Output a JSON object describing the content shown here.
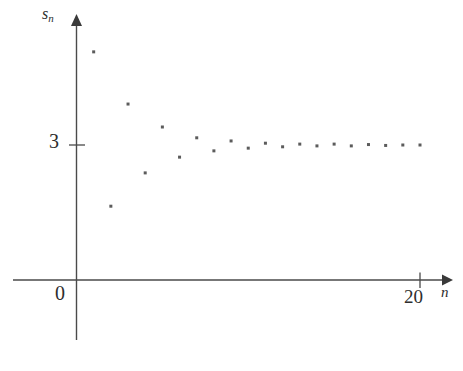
{
  "figure": {
    "background_color": "#ffffff",
    "axis_color": "#4a4a4a",
    "point_color": "#5c5c5c",
    "label_color": "#2e2e2e"
  },
  "labels": {
    "y_axis_name_base": "s",
    "y_axis_name_subscript": "n",
    "y_tick_3": "3",
    "origin_zero": "0",
    "x_tick_20": "20",
    "x_axis_name": "n"
  },
  "chart_data": {
    "type": "scatter",
    "title": "",
    "xlabel": "n",
    "ylabel": "s_n",
    "grid": false,
    "legend": "none",
    "xlim": [
      0,
      21.5
    ],
    "ylim": [
      0,
      6.2
    ],
    "x_ticks": [
      0,
      20
    ],
    "x_tick_labels": [
      "0",
      "20"
    ],
    "y_ticks": [
      0,
      3
    ],
    "y_tick_labels": [
      "0",
      "3"
    ],
    "marker": "square",
    "marker_size_px": 3,
    "x": [
      1,
      2,
      3,
      4,
      5,
      6,
      7,
      8,
      9,
      10,
      11,
      12,
      13,
      14,
      15,
      16,
      17,
      18,
      19,
      20
    ],
    "values": [
      5.07,
      1.64,
      3.91,
      2.38,
      3.4,
      2.73,
      3.16,
      2.87,
      3.09,
      2.93,
      3.04,
      2.96,
      3.02,
      2.98,
      3.02,
      2.98,
      3.01,
      2.99,
      3.0,
      3.0
    ],
    "converges_to": 3,
    "annotations": []
  }
}
